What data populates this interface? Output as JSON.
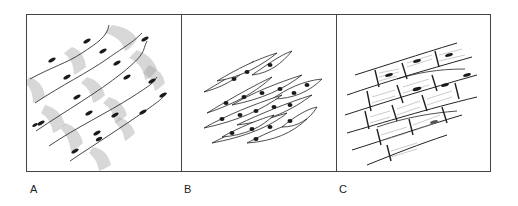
{
  "figure": {
    "panels": [
      {
        "label": "A",
        "subject": "striated fibers with banded shading and elongated nuclei"
      },
      {
        "label": "B",
        "subject": "spindle-shaped cells with central nuclei"
      },
      {
        "label": "C",
        "subject": "branching striated fibers with intercalated junctions and nuclei"
      }
    ]
  },
  "colors": {
    "frame": "#444444",
    "ink": "#222222",
    "hatch": "#9a9a9a",
    "background": "#ffffff"
  }
}
